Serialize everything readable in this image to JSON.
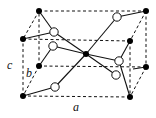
{
  "diagram": {
    "type": "crystal-unit-cell",
    "colors": {
      "line": "#111111",
      "filled_atom": "#000000",
      "open_atom_fill": "#ffffff"
    },
    "axis_labels": [
      {
        "id": "a",
        "text": "a",
        "x": 73,
        "y": 111
      },
      {
        "id": "b",
        "text": "b",
        "x": 26,
        "y": 77
      },
      {
        "id": "c",
        "text": "c",
        "x": 7,
        "y": 69
      }
    ],
    "cell_corners": {
      "top_back_left": [
        39,
        11
      ],
      "top_back_right": [
        146,
        11
      ],
      "bottom_back_left": [
        39,
        66
      ],
      "bottom_back_right": [
        146,
        67
      ],
      "top_front_left": [
        23,
        39
      ],
      "top_front_right": [
        130,
        41
      ],
      "bottom_front_left": [
        23,
        96
      ],
      "bottom_front_right": [
        130,
        97
      ]
    },
    "filled_atoms": [
      {
        "id": "tbl",
        "x": 39,
        "y": 11
      },
      {
        "id": "tbr",
        "x": 146,
        "y": 11
      },
      {
        "id": "tfl",
        "x": 23,
        "y": 39
      },
      {
        "id": "tfr",
        "x": 130,
        "y": 41
      },
      {
        "id": "center",
        "x": 86,
        "y": 54
      },
      {
        "id": "bbl",
        "x": 39,
        "y": 66
      },
      {
        "id": "bbr",
        "x": 146,
        "y": 67
      },
      {
        "id": "bfl",
        "x": 23,
        "y": 96
      },
      {
        "id": "bfr",
        "x": 130,
        "y": 97
      }
    ],
    "open_atoms": [
      {
        "id": "o1",
        "x": 54,
        "y": 32
      },
      {
        "id": "o2",
        "x": 117,
        "y": 17
      },
      {
        "id": "o3",
        "x": 53,
        "y": 46
      },
      {
        "id": "o4",
        "x": 119,
        "y": 61
      },
      {
        "id": "o5",
        "x": 116,
        "y": 75
      },
      {
        "id": "o6",
        "x": 55,
        "y": 87
      }
    ],
    "bonds": [
      [
        23,
        39,
        54,
        32
      ],
      [
        39,
        11,
        54,
        32
      ],
      [
        54,
        32,
        86,
        54
      ],
      [
        39,
        66,
        53,
        46
      ],
      [
        53,
        46,
        86,
        54
      ],
      [
        86,
        54,
        117,
        17
      ],
      [
        117,
        17,
        146,
        11
      ],
      [
        86,
        54,
        55,
        87
      ],
      [
        55,
        87,
        23,
        96
      ],
      [
        86,
        54,
        119,
        61
      ],
      [
        119,
        61,
        130,
        41
      ],
      [
        119,
        61,
        130,
        97
      ],
      [
        86,
        54,
        116,
        75
      ],
      [
        146,
        67,
        133,
        69
      ]
    ]
  }
}
